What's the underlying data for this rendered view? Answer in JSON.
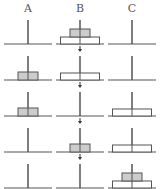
{
  "posts": [
    {
      "label": "A",
      "x": 28
    },
    {
      "label": "B",
      "x": 80
    },
    {
      "label": "C",
      "x": 132
    }
  ],
  "colors": {
    "line": "#555555",
    "small_disk_fill": "#cccccc",
    "large_disk_fill": "#ffffff",
    "arrow": "#333333"
  },
  "rows": [
    {
      "baseline": 44,
      "A": [],
      "B": [
        "large",
        "small"
      ],
      "C": []
    },
    {
      "baseline": 80,
      "A": [
        "small"
      ],
      "B": [
        "large"
      ],
      "C": []
    },
    {
      "baseline": 116,
      "A": [
        "small"
      ],
      "B": [],
      "C": [
        "large"
      ]
    },
    {
      "baseline": 152,
      "A": [],
      "B": [
        "small"
      ],
      "C": [
        "large"
      ]
    },
    {
      "baseline": 188,
      "A": [],
      "B": [],
      "C": [
        "large",
        "small"
      ]
    }
  ],
  "arrows": [
    {
      "x": 80,
      "y": 48
    },
    {
      "x": 80,
      "y": 84
    },
    {
      "x": 80,
      "y": 120
    },
    {
      "x": 80,
      "y": 156
    }
  ]
}
